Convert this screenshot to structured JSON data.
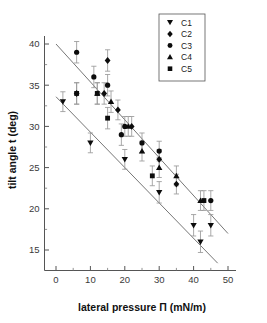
{
  "chart_data": {
    "type": "scatter",
    "title": "",
    "xlabel": "lateral pressure Π (mN/m)",
    "ylabel": "tilt angle t (deg)",
    "xlim": [
      -3,
      52
    ],
    "ylim": [
      13,
      41.5
    ],
    "xticks": [
      0,
      10,
      20,
      30,
      40,
      50
    ],
    "xticklabels": [
      "0",
      "10",
      "20",
      "30",
      "40",
      "50"
    ],
    "xminorticks": [
      5,
      15,
      25,
      35,
      45
    ],
    "yticks": [
      15,
      20,
      25,
      30,
      35,
      40
    ],
    "yticklabels": [
      "15",
      "20",
      "25",
      "30",
      "35",
      "40"
    ],
    "yminorticks": [
      17.5,
      22.5,
      27.5,
      32.5,
      37.5
    ],
    "grid": false,
    "legend_position": "top-right",
    "series": [
      {
        "name": "C1",
        "marker": "triangle-down",
        "color": "#0c0c0c",
        "points": [
          {
            "x": 2,
            "y": 33,
            "err": 1.2
          },
          {
            "x": 10,
            "y": 28,
            "err": 1.2
          },
          {
            "x": 20,
            "y": 26,
            "err": 1.2
          },
          {
            "x": 30,
            "y": 22,
            "err": 1.3
          },
          {
            "x": 40,
            "y": 18,
            "err": 1.3
          },
          {
            "x": 42,
            "y": 16,
            "err": 1.3
          },
          {
            "x": 45,
            "y": 18,
            "err": 1.3
          }
        ]
      },
      {
        "name": "C2",
        "marker": "diamond",
        "color": "#0c0c0c",
        "points": [
          {
            "x": 6,
            "y": 34,
            "err": 1.3
          },
          {
            "x": 14,
            "y": 34,
            "err": 1.3
          },
          {
            "x": 15,
            "y": 38,
            "err": 1.3
          },
          {
            "x": 18,
            "y": 32,
            "err": 1.2
          },
          {
            "x": 22,
            "y": 30,
            "err": 1.2
          },
          {
            "x": 30,
            "y": 26,
            "err": 1.2
          },
          {
            "x": 35,
            "y": 23,
            "err": 1.2
          }
        ]
      },
      {
        "name": "C3",
        "marker": "circle",
        "color": "#0c0c0c",
        "points": [
          {
            "x": 6,
            "y": 39,
            "err": 1.3
          },
          {
            "x": 11,
            "y": 36,
            "err": 1.3
          },
          {
            "x": 15,
            "y": 35,
            "err": 1.3
          },
          {
            "x": 19,
            "y": 29,
            "err": 1.3
          },
          {
            "x": 20,
            "y": 30,
            "err": 1.2
          },
          {
            "x": 25,
            "y": 28,
            "err": 1.2
          },
          {
            "x": 30,
            "y": 27,
            "err": 1.2
          },
          {
            "x": 45,
            "y": 21,
            "err": 1.2
          }
        ]
      },
      {
        "name": "C4",
        "marker": "triangle-up",
        "color": "#0c0c0c",
        "points": [
          {
            "x": 12,
            "y": 34,
            "err": 1.3
          },
          {
            "x": 16,
            "y": 33,
            "err": 1.3
          },
          {
            "x": 21,
            "y": 30,
            "err": 1.2
          },
          {
            "x": 25,
            "y": 27,
            "err": 1.2
          },
          {
            "x": 30,
            "y": 25,
            "err": 1.2
          },
          {
            "x": 35,
            "y": 24,
            "err": 1.2
          },
          {
            "x": 42,
            "y": 21,
            "err": 1.2
          }
        ]
      },
      {
        "name": "C5",
        "marker": "square",
        "color": "#0c0c0c",
        "points": [
          {
            "x": 6,
            "y": 34,
            "err": 1.3
          },
          {
            "x": 15,
            "y": 31,
            "err": 1.3
          },
          {
            "x": 12,
            "y": 34,
            "err": 1.3
          },
          {
            "x": 28,
            "y": 24,
            "err": 1.2
          },
          {
            "x": 43,
            "y": 21,
            "err": 1.2
          }
        ]
      }
    ],
    "fit_lines": [
      {
        "name": "upper-fit",
        "x0": 0,
        "y0": 40.0,
        "x1": 50,
        "y1": 17.0
      },
      {
        "name": "lower-fit",
        "x0": 0,
        "y0": 33.6,
        "x1": 47,
        "y1": 13.4
      }
    ],
    "legend": [
      {
        "label": "C1",
        "marker": "triangle-down"
      },
      {
        "label": "C2",
        "marker": "diamond"
      },
      {
        "label": "C3",
        "marker": "circle"
      },
      {
        "label": "C4",
        "marker": "triangle-up"
      },
      {
        "label": "C5",
        "marker": "square"
      }
    ]
  }
}
